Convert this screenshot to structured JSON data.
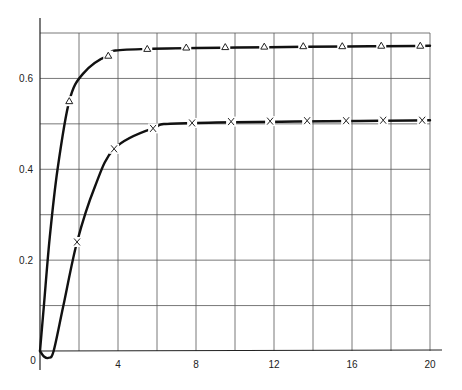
{
  "chart_data": {
    "type": "line",
    "title": "",
    "xlabel": "",
    "ylabel": "",
    "xlim": [
      0,
      20
    ],
    "ylim": [
      0,
      0.7
    ],
    "grid": true,
    "legend": null,
    "x_ticks": [
      0,
      2,
      4,
      6,
      8,
      10,
      12,
      14,
      16,
      18,
      20
    ],
    "x_tick_labels": [
      "",
      "",
      "4",
      "",
      "8",
      "",
      "12",
      "",
      "16",
      "",
      "20"
    ],
    "y_ticks": [
      0,
      0.1,
      0.2,
      0.3,
      0.4,
      0.5,
      0.6,
      0.7
    ],
    "y_tick_labels": [
      "0",
      "",
      "0.2",
      "",
      "0.4",
      "",
      "0.6",
      ""
    ],
    "origin_label": "0",
    "series": [
      {
        "name": "upper (triangle markers)",
        "marker": "triangle",
        "points": [
          {
            "x": 1.5,
            "y": 0.55
          },
          {
            "x": 3.5,
            "y": 0.65
          },
          {
            "x": 5.5,
            "y": 0.665
          },
          {
            "x": 7.5,
            "y": 0.668
          },
          {
            "x": 9.5,
            "y": 0.669
          },
          {
            "x": 11.5,
            "y": 0.67
          },
          {
            "x": 13.5,
            "y": 0.671
          },
          {
            "x": 15.5,
            "y": 0.671
          },
          {
            "x": 17.5,
            "y": 0.672
          },
          {
            "x": 19.5,
            "y": 0.672
          }
        ],
        "curve": [
          {
            "x": 0,
            "y": 0.0
          },
          {
            "x": 0.2,
            "y": 0.1
          },
          {
            "x": 0.5,
            "y": 0.25
          },
          {
            "x": 0.9,
            "y": 0.4
          },
          {
            "x": 1.5,
            "y": 0.55
          },
          {
            "x": 2.2,
            "y": 0.61
          },
          {
            "x": 3.5,
            "y": 0.65
          },
          {
            "x": 5.5,
            "y": 0.665
          },
          {
            "x": 20,
            "y": 0.672
          }
        ]
      },
      {
        "name": "lower (cross markers)",
        "marker": "x",
        "points": [
          {
            "x": 1.9,
            "y": 0.24
          },
          {
            "x": 3.8,
            "y": 0.445
          },
          {
            "x": 5.8,
            "y": 0.49
          },
          {
            "x": 7.8,
            "y": 0.502
          },
          {
            "x": 9.8,
            "y": 0.505
          },
          {
            "x": 11.8,
            "y": 0.506
          },
          {
            "x": 13.7,
            "y": 0.507
          },
          {
            "x": 15.7,
            "y": 0.507
          },
          {
            "x": 17.6,
            "y": 0.508
          },
          {
            "x": 19.6,
            "y": 0.508
          }
        ],
        "curve": [
          {
            "x": 0,
            "y": 0.0
          },
          {
            "x": 0.2,
            "y": -0.012
          },
          {
            "x": 0.45,
            "y": -0.015
          },
          {
            "x": 0.7,
            "y": 0.0
          },
          {
            "x": 1.2,
            "y": 0.1
          },
          {
            "x": 1.9,
            "y": 0.24
          },
          {
            "x": 2.8,
            "y": 0.36
          },
          {
            "x": 3.8,
            "y": 0.445
          },
          {
            "x": 5.8,
            "y": 0.49
          },
          {
            "x": 7.8,
            "y": 0.502
          },
          {
            "x": 20,
            "y": 0.508
          }
        ]
      }
    ]
  }
}
